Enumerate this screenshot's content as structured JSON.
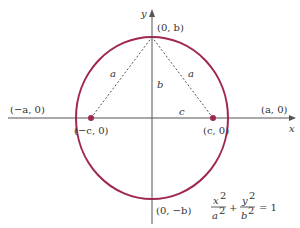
{
  "diagram": {
    "type": "ellipse-foci",
    "colors": {
      "ellipse": "#a0284e",
      "axes": "#555555",
      "dashed": "#555555",
      "focus": "#a0284e",
      "text": "#333333"
    },
    "axes": {
      "x_label": "x",
      "y_label": "y"
    },
    "vertices": {
      "top": "(0, b)",
      "bottom": "(0, −b)",
      "left": "(−a, 0)",
      "right": "(a, 0)"
    },
    "foci": {
      "left": "(−c, 0)",
      "right": "(c, 0)"
    },
    "segment_labels": {
      "left_hyp": "a",
      "right_hyp": "a",
      "vertical": "b",
      "horizontal": "c"
    },
    "equation": {
      "t1_num": "x",
      "t1_den": "a",
      "t2_num": "y",
      "t2_den": "b",
      "exp": "2",
      "plus": "+",
      "rhs": "= 1"
    }
  }
}
